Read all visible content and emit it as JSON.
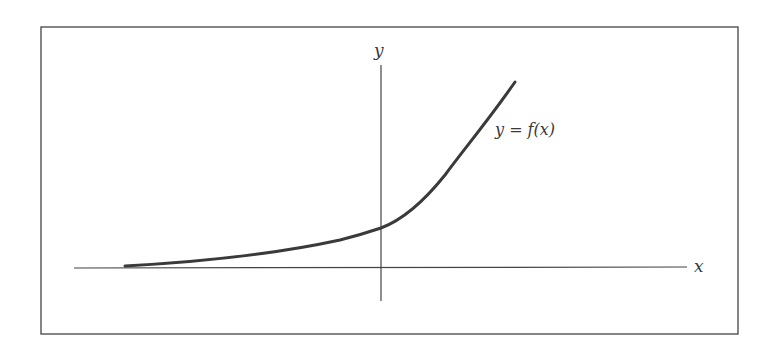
{
  "figure": {
    "type": "function-graph",
    "axes": {
      "x_label": "x",
      "y_label": "y"
    },
    "curve": {
      "label": "y = f(x)",
      "shape": "exponential growth",
      "color": "#3a3a3a"
    },
    "colors": {
      "frame": "#444444",
      "axes": "#444444",
      "text": "#3a3a3a",
      "background": "#ffffff"
    }
  }
}
